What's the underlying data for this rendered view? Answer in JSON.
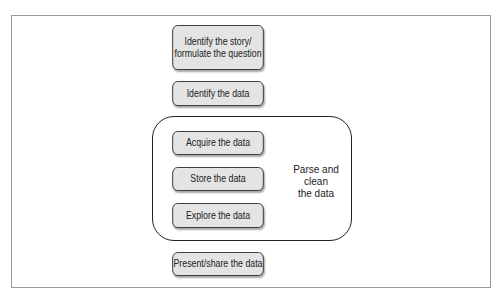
{
  "diagram": {
    "steps": [
      {
        "id": "identify-story",
        "lines": [
          "Identify the story/",
          "formulate the question"
        ]
      },
      {
        "id": "identify-data",
        "label": "Identify the data"
      },
      {
        "id": "acquire-data",
        "label": "Acquire the data"
      },
      {
        "id": "store-data",
        "label": "Store the data"
      },
      {
        "id": "explore-data",
        "label": "Explore the data"
      },
      {
        "id": "present-data",
        "label": "Present/share the data"
      }
    ],
    "group": {
      "label": "Parse and clean the data",
      "label_lines": [
        "Parse and clean",
        "the data"
      ],
      "members": [
        "acquire-data",
        "store-data",
        "explore-data"
      ]
    },
    "colors": {
      "box_fill": "#e4e4e4",
      "box_border": "#333333",
      "frame_border": "#9a9a9a"
    }
  }
}
